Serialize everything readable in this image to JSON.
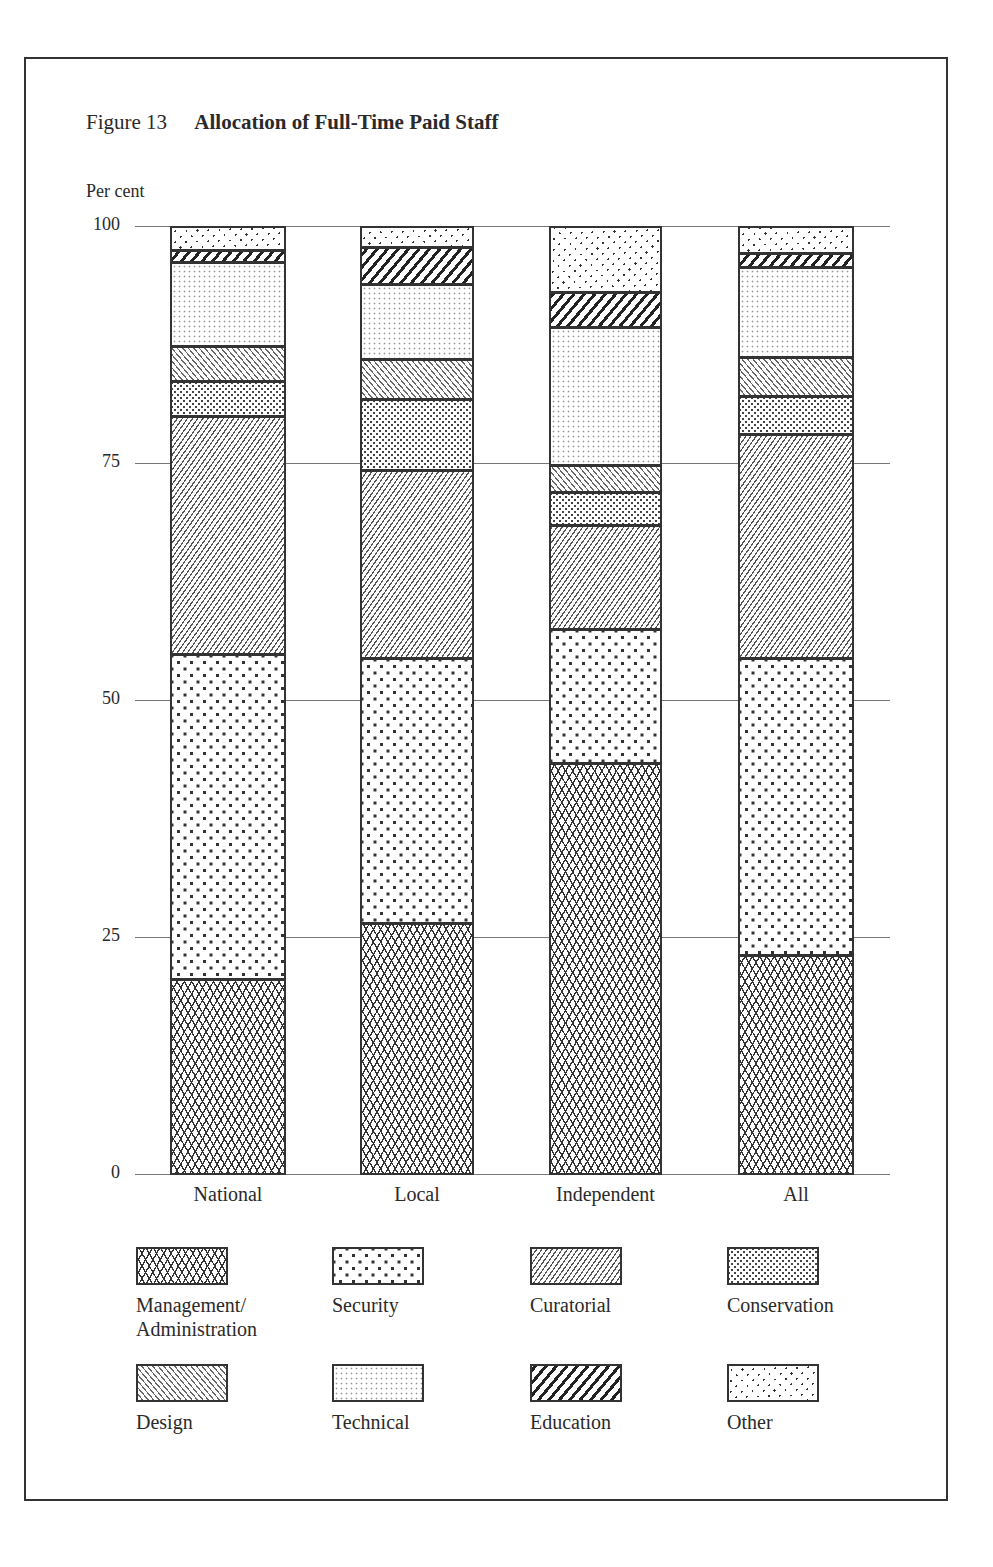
{
  "figure": {
    "number": "Figure 13",
    "title": "Allocation of Full-Time Paid Staff"
  },
  "axis": {
    "ylabel": "Per cent",
    "ticks": [
      "100",
      "75",
      "50",
      "25",
      "0"
    ]
  },
  "categories_labels": [
    "National",
    "Local",
    "Independent",
    "All"
  ],
  "legend": [
    {
      "label": "Management/ Administration",
      "pattern": "management"
    },
    {
      "label": "Security",
      "pattern": "security"
    },
    {
      "label": "Curatorial",
      "pattern": "curatorial"
    },
    {
      "label": "Conservation",
      "pattern": "conservation"
    },
    {
      "label": "Design",
      "pattern": "design"
    },
    {
      "label": "Technical",
      "pattern": "technical"
    },
    {
      "label": "Education",
      "pattern": "education"
    },
    {
      "label": "Other",
      "pattern": "other"
    }
  ],
  "chart_data": {
    "type": "bar",
    "stacked": true,
    "title": "Figure 13 Allocation of Full-Time Paid Staff",
    "xlabel": "",
    "ylabel": "Per cent",
    "ylim": [
      0,
      100
    ],
    "yticks": [
      0,
      25,
      50,
      75,
      100
    ],
    "grid": true,
    "legend_position": "bottom",
    "categories": [
      "National",
      "Local",
      "Independent",
      "All"
    ],
    "series": [
      {
        "name": "Management/Administration",
        "values": [
          20.6,
          26.5,
          43.4,
          23.1
        ]
      },
      {
        "name": "Security",
        "values": [
          34.3,
          27.9,
          14.1,
          31.3
        ]
      },
      {
        "name": "Curatorial",
        "values": [
          25.1,
          19.9,
          11.0,
          23.7
        ]
      },
      {
        "name": "Conservation",
        "values": [
          3.7,
          7.5,
          3.4,
          4.0
        ]
      },
      {
        "name": "Design",
        "values": [
          3.6,
          4.2,
          2.9,
          4.1
        ]
      },
      {
        "name": "Technical",
        "values": [
          8.9,
          7.9,
          14.5,
          9.5
        ]
      },
      {
        "name": "Education",
        "values": [
          1.3,
          3.9,
          3.7,
          1.5
        ]
      },
      {
        "name": "Other",
        "values": [
          2.5,
          2.2,
          7.0,
          2.8
        ]
      }
    ]
  }
}
